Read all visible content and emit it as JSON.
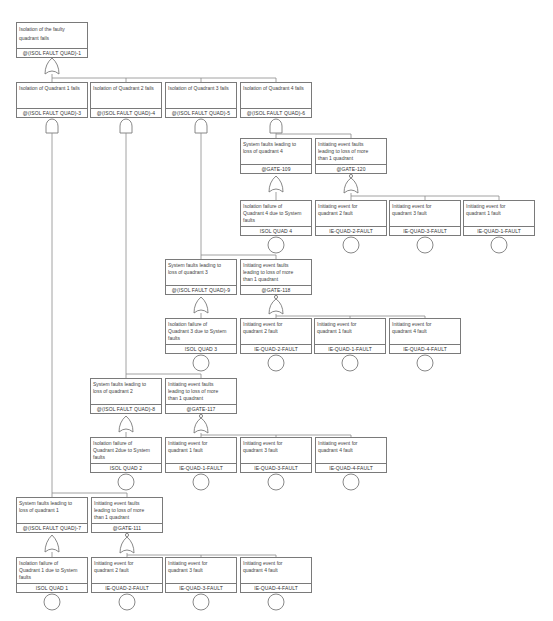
{
  "diagram": {
    "type": "fault-tree",
    "top": {
      "desc": "Isolation of the faulty\nquadrant fails",
      "id": "@(ISOL FAULT QUAD)-1",
      "gate": "OR"
    },
    "level1": [
      {
        "desc": "Isolation of Quadrant 1 fails",
        "id": "@(ISOL FAULT QUAD)-3",
        "gate": "AND"
      },
      {
        "desc": "Isolation of Quadrant 2 fails",
        "id": "@(ISOL FAULT QUAD)-4",
        "gate": "AND"
      },
      {
        "desc": "Isolation of Quadrant 3 fails",
        "id": "@(ISOL FAULT QUAD)-5",
        "gate": "AND"
      },
      {
        "desc": "Isolation of Quadrant 4 fails",
        "id": "@(ISOL FAULT QUAD)-6",
        "gate": "AND"
      }
    ],
    "q4": {
      "sys": {
        "desc": "System faults leading to\nloss of quadrant 4",
        "id": "@GATE-109",
        "gate": "OR"
      },
      "ie": {
        "desc": "Initiating event faults\nleading to loss of more\nthan 1 quadrant",
        "id": "@GATE-120",
        "gate": "OR"
      },
      "leaves": [
        {
          "desc": "Isolation failure of\nQuadrant 4 due to System\nfaults",
          "id": "ISOL QUAD 4"
        },
        {
          "desc": "Initiating event for\nquadrant 2 fault",
          "id": "IE-QUAD-2-FAULT"
        },
        {
          "desc": "Initiating event for\nquadrant 3 fault",
          "id": "IE-QUAD-3-FAULT"
        },
        {
          "desc": "Initiating event for\nquadrant 1 fault",
          "id": "IE-QUAD-1-FAULT"
        }
      ]
    },
    "q3": {
      "sys": {
        "desc": "System faults leading to\nloss of quadrant 3",
        "id": "@(ISOL FAULT QUAD)-9",
        "gate": "OR"
      },
      "ie": {
        "desc": "Initiating event faults\nleading to loss of more\nthan 1 quadrant",
        "id": "@GATE-118",
        "gate": "OR"
      },
      "leaves": [
        {
          "desc": "Isolation failure of\nQuadrant 3 due to System\nfaults",
          "id": "ISOL QUAD 3"
        },
        {
          "desc": "Initiating event for\nquadrant 2 fault",
          "id": "IE-QUAD-2-FAULT"
        },
        {
          "desc": "Initiating event for\nquadrant 1 fault",
          "id": "IE-QUAD-1-FAULT"
        },
        {
          "desc": "Initiating event for\nquadrant 4 fault",
          "id": "IE-QUAD-4-FAULT"
        }
      ]
    },
    "q2": {
      "sys": {
        "desc": "System faults leading to\nloss of quadrant 2",
        "id": "@(ISOL FAULT QUAD)-8",
        "gate": "OR"
      },
      "ie": {
        "desc": "Initiating event faults\nleading to loss of more\nthan 1 quadrant",
        "id": "@GATE-117",
        "gate": "OR"
      },
      "leaves": [
        {
          "desc": "Isolation failure of\nQuadrant 2due to System\nfaults",
          "id": "ISOL QUAD 2"
        },
        {
          "desc": "Initiating event for\nquadrant 1 fault",
          "id": "IE-QUAD-1-FAULT"
        },
        {
          "desc": "Initiating event for\nquadrant 3 fault",
          "id": "IE-QUAD-3-FAULT"
        },
        {
          "desc": "Initiating event for\nquadrant 4 fault",
          "id": "IE-QUAD-4-FAULT"
        }
      ]
    },
    "q1": {
      "sys": {
        "desc": "System faults leading to\nloss of quadrant 1",
        "id": "@(ISOL FAULT QUAD)-7",
        "gate": "OR"
      },
      "ie": {
        "desc": "Initiating event faults\nleading to loss of more\nthan 1 quadrant",
        "id": "@GATE-111",
        "gate": "OR"
      },
      "leaves": [
        {
          "desc": "Isolation failure of\nQuadrant 1 due to System\nfaults",
          "id": "ISOL QUAD 1"
        },
        {
          "desc": "Initiating event for\nquadrant 2 fault",
          "id": "IE-QUAD-2-FAULT"
        },
        {
          "desc": "Initiating event for\nquadrant 3 fault",
          "id": "IE-QUAD-3-FAULT"
        },
        {
          "desc": "Initiating event for\nquadrant 4 fault",
          "id": "IE-QUAD-4-FAULT"
        }
      ]
    }
  }
}
